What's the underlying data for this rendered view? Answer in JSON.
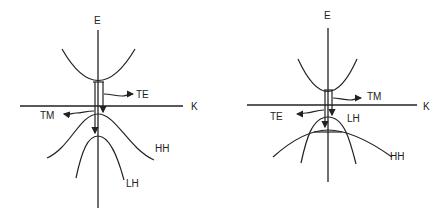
{
  "diagrams": [
    {
      "name": "left-band-diagram",
      "axis_labels": {
        "energy": "E",
        "momentum": "K"
      },
      "bands": [
        "HH",
        "LH"
      ],
      "emission": {
        "upper_arrow": "TE",
        "lower_arrow": "TM"
      },
      "band_order": "HH above LH at K=0"
    },
    {
      "name": "right-band-diagram",
      "axis_labels": {
        "energy": "E",
        "momentum": "K"
      },
      "bands": [
        "LH",
        "HH"
      ],
      "emission": {
        "upper_arrow": "TM",
        "lower_arrow": "TE"
      },
      "band_order": "LH above HH at K=0"
    }
  ]
}
